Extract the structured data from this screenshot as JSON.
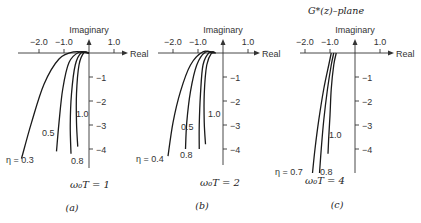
{
  "figure_title": "G*(z)–plane",
  "chart_data": [
    {
      "type": "line",
      "panel_label": "(a)",
      "parameter_label": "ω₀T = 1",
      "xlabel": "Real",
      "ylabel": "Imaginary",
      "x_tick_labels": [
        "−2.0",
        "−1.0",
        "1.0"
      ],
      "x_ticks": [
        -2.0,
        -1.0,
        1.0
      ],
      "y_tick_labels": [
        "−1",
        "−2",
        "−3",
        "−4"
      ],
      "y_ticks": [
        -1,
        -2,
        -3,
        -4
      ],
      "xlim": [
        -2.7,
        1.6
      ],
      "ylim": [
        -4.7,
        0.5
      ],
      "grid": false,
      "series": [
        {
          "name": "η = 0.3",
          "label": "η = 0.3",
          "points": [
            [
              0,
              0
            ],
            [
              -0.6,
              0.05
            ],
            [
              -1.2,
              -0.25
            ],
            [
              -1.8,
              -1.3
            ],
            [
              -2.3,
              -2.9
            ],
            [
              -2.7,
              -4.4
            ]
          ]
        },
        {
          "name": "0.5",
          "label": "0.5",
          "points": [
            [
              0,
              0
            ],
            [
              -0.4,
              0.03
            ],
            [
              -0.8,
              -0.4
            ],
            [
              -1.05,
              -1.5
            ],
            [
              -1.2,
              -2.9
            ],
            [
              -1.3,
              -4.1
            ]
          ]
        },
        {
          "name": "0.8",
          "label": "0.8",
          "points": [
            [
              0,
              0
            ],
            [
              -0.3,
              0.02
            ],
            [
              -0.55,
              -0.5
            ],
            [
              -0.7,
              -1.7
            ],
            [
              -0.75,
              -3.0
            ],
            [
              -0.72,
              -4.2
            ]
          ]
        },
        {
          "name": "1.0",
          "label": "1.0",
          "points": [
            [
              0,
              0
            ],
            [
              -0.2,
              0.02
            ],
            [
              -0.4,
              -0.5
            ],
            [
              -0.5,
              -1.7
            ],
            [
              -0.5,
              -2.9
            ],
            [
              -0.45,
              -3.9
            ]
          ]
        }
      ]
    },
    {
      "type": "line",
      "panel_label": "(b)",
      "parameter_label": "ω₀T = 2",
      "xlabel": "Real",
      "ylabel": "Imaginary",
      "x_tick_labels": [
        "−2.0",
        "−1.0",
        "1.0"
      ],
      "x_ticks": [
        -2.0,
        -1.0,
        1.0
      ],
      "y_tick_labels": [
        "−1",
        "−2",
        "−3",
        "−4"
      ],
      "y_ticks": [
        -1,
        -2,
        -3,
        -4
      ],
      "xlim": [
        -2.7,
        1.6
      ],
      "ylim": [
        -4.7,
        0.5
      ],
      "grid": false,
      "series": [
        {
          "name": "η = 0.4",
          "label": "η = 0.4",
          "points": [
            [
              -0.4,
              0
            ],
            [
              -0.8,
              0.05
            ],
            [
              -1.3,
              -0.5
            ],
            [
              -1.7,
              -1.6
            ],
            [
              -2.0,
              -2.9
            ],
            [
              -2.2,
              -4.3
            ]
          ]
        },
        {
          "name": "0.5",
          "label": "0.5",
          "points": [
            [
              -0.35,
              0
            ],
            [
              -0.7,
              0.04
            ],
            [
              -1.05,
              -0.5
            ],
            [
              -1.3,
              -1.6
            ],
            [
              -1.45,
              -2.9
            ],
            [
              -1.5,
              -4.0
            ]
          ]
        },
        {
          "name": "0.8",
          "label": "0.8",
          "points": [
            [
              -0.3,
              0
            ],
            [
              -0.55,
              0.02
            ],
            [
              -0.8,
              -0.5
            ],
            [
              -0.9,
              -1.7
            ],
            [
              -0.95,
              -3.0
            ],
            [
              -0.95,
              -4.0
            ]
          ]
        },
        {
          "name": "1.0",
          "label": "1.0",
          "points": [
            [
              -0.3,
              0
            ],
            [
              -0.45,
              0.02
            ],
            [
              -0.65,
              -0.5
            ],
            [
              -0.75,
              -1.7
            ],
            [
              -0.75,
              -2.9
            ],
            [
              -0.7,
              -3.8
            ]
          ]
        }
      ]
    },
    {
      "type": "line",
      "panel_label": "(c)",
      "parameter_label": "ω₀T = 4",
      "xlabel": "Real",
      "ylabel": "Imaginary",
      "x_tick_labels": [
        "−2.0",
        "−1.0",
        "1.0"
      ],
      "x_ticks": [
        -2.0,
        -1.0,
        1.0
      ],
      "y_tick_labels": [
        "−1",
        "−2",
        "−3",
        "−4"
      ],
      "y_ticks": [
        -1,
        -2,
        -3,
        -4
      ],
      "xlim": [
        -2.7,
        1.6
      ],
      "ylim": [
        -5.0,
        0.5
      ],
      "grid": false,
      "series": [
        {
          "name": "η = 0.7",
          "label": "η = 0.7",
          "points": [
            [
              -0.95,
              0
            ],
            [
              -1.05,
              -0.5
            ],
            [
              -1.25,
              -1.5
            ],
            [
              -1.45,
              -2.8
            ],
            [
              -1.6,
              -4.0
            ],
            [
              -1.7,
              -5.0
            ]
          ]
        },
        {
          "name": "0.8",
          "label": "0.8",
          "points": [
            [
              -0.85,
              0
            ],
            [
              -0.95,
              -0.5
            ],
            [
              -1.1,
              -1.5
            ],
            [
              -1.25,
              -2.8
            ],
            [
              -1.35,
              -4.0
            ],
            [
              -1.42,
              -5.0
            ]
          ]
        },
        {
          "name": "1.0",
          "label": "1.0",
          "points": [
            [
              -0.75,
              0
            ],
            [
              -0.85,
              -0.5
            ],
            [
              -0.95,
              -1.5
            ],
            [
              -1.0,
              -2.6
            ],
            [
              -1.05,
              -3.5
            ],
            [
              -1.08,
              -4.2
            ]
          ]
        }
      ]
    }
  ]
}
